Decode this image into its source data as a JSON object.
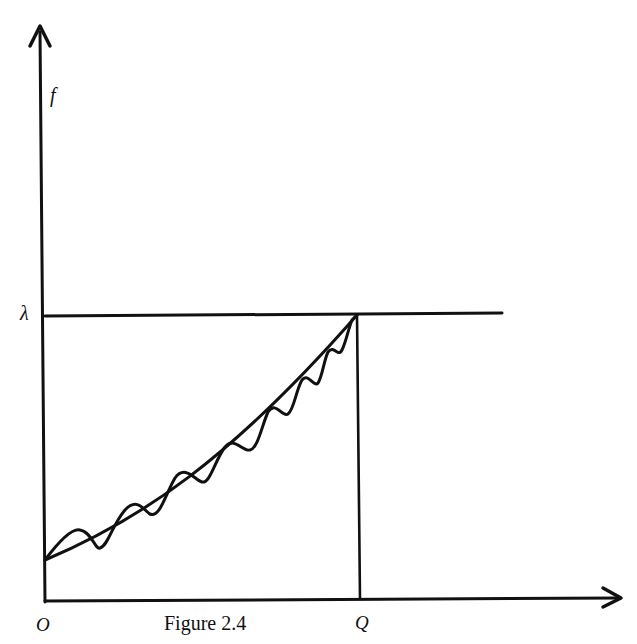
{
  "figure": {
    "caption": "Figure 2.4",
    "labels": {
      "y_axis": "f",
      "lambda": "λ",
      "origin": "O",
      "q": "Q"
    },
    "colors": {
      "ink": "#111111",
      "background": "#ffffff"
    }
  }
}
